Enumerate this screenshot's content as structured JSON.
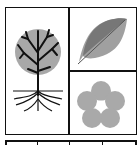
{
  "figure": {
    "panels": [
      {
        "name": "tree",
        "position": "left"
      },
      {
        "name": "leaf",
        "position": "top-right"
      },
      {
        "name": "flower",
        "position": "bottom-right"
      }
    ],
    "bottom_strip": {
      "cells": 4
    }
  },
  "colors": {
    "stroke": "#111111",
    "tree_canopy": "#a8a8a8",
    "leaf_dark": "#777777",
    "leaf_light": "#a0a0a0",
    "flower": "#a9a9a9"
  }
}
